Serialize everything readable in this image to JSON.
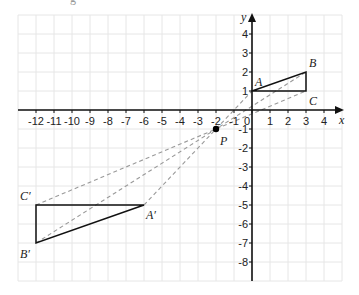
{
  "diagram": {
    "type": "coordinate-grid-enlargement",
    "grid": {
      "x_min": -13,
      "x_max": 5,
      "y_min": -9,
      "y_max": 5,
      "origin_px": [
        252,
        110
      ],
      "unit_px_x": 18,
      "unit_px_y": 19,
      "grid_color": "#e6e6e6",
      "axis_color": "#111111"
    },
    "axes": {
      "x_label": "x",
      "y_label": "y",
      "x_ticks": [
        {
          "v": -12,
          "t": "-12"
        },
        {
          "v": -11,
          "t": "-11"
        },
        {
          "v": -10,
          "t": "-10"
        },
        {
          "v": -9,
          "t": "-9"
        },
        {
          "v": -8,
          "t": "-8"
        },
        {
          "v": -7,
          "t": "-7"
        },
        {
          "v": -6,
          "t": "-6"
        },
        {
          "v": -5,
          "t": "-5"
        },
        {
          "v": -4,
          "t": "-4"
        },
        {
          "v": -3,
          "t": "-3"
        },
        {
          "v": -2,
          "t": "-2"
        },
        {
          "v": -1,
          "t": "-1"
        },
        {
          "v": 0,
          "t": "0"
        },
        {
          "v": 1,
          "t": "1"
        },
        {
          "v": 2,
          "t": "2"
        },
        {
          "v": 3,
          "t": "3"
        },
        {
          "v": 4,
          "t": "4"
        }
      ],
      "y_ticks": [
        {
          "v": 4,
          "t": "4"
        },
        {
          "v": 3,
          "t": "3"
        },
        {
          "v": 2,
          "t": "2"
        },
        {
          "v": 1,
          "t": "1"
        },
        {
          "v": -1,
          "t": "-1"
        },
        {
          "v": -2,
          "t": "-2"
        },
        {
          "v": -3,
          "t": "-3"
        },
        {
          "v": -4,
          "t": "-4"
        },
        {
          "v": -5,
          "t": "-5"
        },
        {
          "v": -6,
          "t": "-6"
        },
        {
          "v": -7,
          "t": "-7"
        },
        {
          "v": -8,
          "t": "-8"
        }
      ]
    },
    "points": {
      "A": {
        "label": "A",
        "x": 0,
        "y": 1
      },
      "B": {
        "label": "B",
        "x": 3,
        "y": 2
      },
      "C": {
        "label": "C",
        "x": 3,
        "y": 1
      },
      "A1": {
        "label": "A′",
        "x": -6,
        "y": -5
      },
      "B1": {
        "label": "B′",
        "x": -12,
        "y": -7
      },
      "C1": {
        "label": "C′",
        "x": -12,
        "y": -5
      },
      "P": {
        "label": "P",
        "x": -2,
        "y": -1
      }
    },
    "triangles": [
      {
        "name": "ABC",
        "vertices": [
          "A",
          "B",
          "C"
        ]
      },
      {
        "name": "A'B'C'",
        "vertices": [
          "A1",
          "B1",
          "C1"
        ]
      }
    ],
    "dashed_rays": [
      {
        "from": "A1",
        "to": "A"
      },
      {
        "from": "B1",
        "to": "B"
      },
      {
        "from": "C1",
        "to": "C"
      }
    ],
    "colors": {
      "triangle": "#111111",
      "dashed": "#9a9a9a",
      "center_point": "#000000"
    }
  }
}
